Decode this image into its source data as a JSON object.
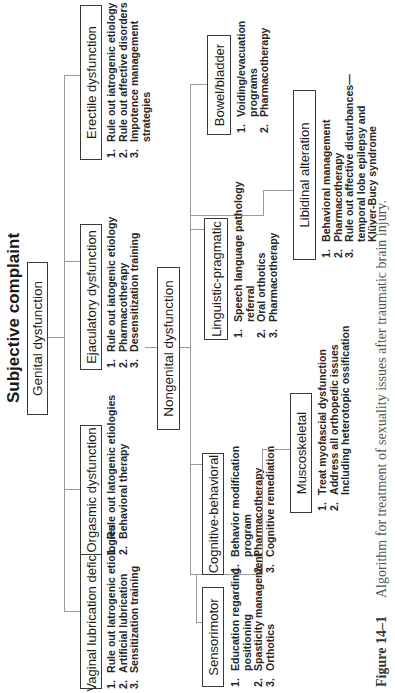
{
  "diagram": {
    "title": "Subjective complaint",
    "genital": {
      "label": "Genital dysfunction",
      "branches": [
        {
          "label": "Vaginal lubrication deficit",
          "items": [
            "Rule out latrogenic etiologies",
            "Artificial lubrication",
            "Sensitization training"
          ]
        },
        {
          "label": "Orgasmic dysfunction",
          "items": [
            "Rule out latogenic etiologies",
            "Behavioral therapy"
          ]
        },
        {
          "label": "Ejaculatory dysfunction",
          "items": [
            "Rule out  iatogenic etiology",
            "Pharmacotherapy",
            "Desensitization training"
          ]
        },
        {
          "label": "Erectile dysfunction",
          "items": [
            "Rule out  iatrogenic etiology",
            "Rule out affective disorders",
            "Impotence management",
            "strategies"
          ]
        }
      ]
    },
    "nongenital": {
      "label": "Nongenital dysfunction",
      "branches": [
        {
          "label": "Sensorimotor",
          "items": [
            "Education regarding",
            "positioning",
            "Spasticity management",
            "Orthotics"
          ]
        },
        {
          "label": "Cognitive-behavioral",
          "items": [
            "Behavior modification",
            "program",
            "Pharmacotherapy",
            "Cognitive remediation"
          ]
        },
        {
          "label": "Linguistic-pragmatic",
          "items": [
            "Speech language pathology",
            "referral",
            "Oral orthotics",
            "Pharmacotherapy"
          ]
        },
        {
          "label": "Bowel/bladder",
          "items": [
            "Voiding/evacuation",
            "programs",
            "Pharmacotherapy"
          ]
        },
        {
          "label": "Muscoskeletal",
          "items": [
            "Treat myofascial dysfunction",
            "Address all orthopedic issues",
            "Including heterotopic ossification"
          ]
        },
        {
          "label": "Libidinal alteration",
          "items": [
            "Behavioral management",
            "Pharmacotherapy",
            "Rule out affective disturbances—",
            "temporal lobe epilepsy and",
            "Klüver-Bucy syndrome"
          ]
        }
      ]
    },
    "numbers": {
      "n1": "1.",
      "n2": "2.",
      "n3": "3."
    },
    "caption": {
      "figure": "Figure 14–1",
      "text": "Algorithm for treatment of sexuality issues after traumatic brain injury."
    }
  }
}
